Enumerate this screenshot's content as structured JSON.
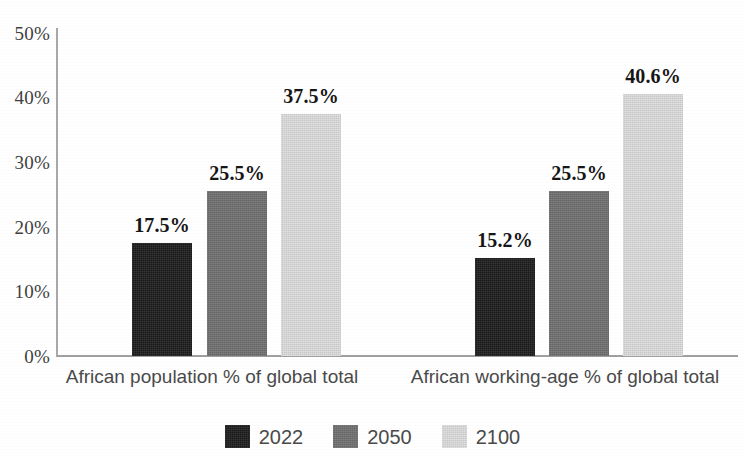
{
  "chart_data": {
    "type": "bar",
    "title": "",
    "subtitle": "",
    "xlabel": "",
    "ylabel": "",
    "categories": [
      "African population % of global total",
      "African working-age % of global total"
    ],
    "series": [
      {
        "name": "2022",
        "color": "#1c1c1c",
        "values": [
          17.5,
          15.2
        ],
        "labels": [
          "17.5%",
          "15.2%"
        ]
      },
      {
        "name": "2050",
        "color": "#6f6f6f",
        "values": [
          25.5,
          25.5
        ],
        "labels": [
          "25.5%",
          "25.5%"
        ]
      },
      {
        "name": "2100",
        "color": "#dddddd",
        "values": [
          37.5,
          40.6
        ],
        "labels": [
          "37.5%",
          "40.6%"
        ]
      }
    ],
    "ylim": [
      0,
      50
    ],
    "ytick_values": [
      0,
      10,
      20,
      30,
      40,
      50
    ],
    "ytick_labels": [
      "0%",
      "10%",
      "20%",
      "30%",
      "40%",
      "50%"
    ],
    "grid": false,
    "legend_position": "bottom",
    "value_labels_shown": true,
    "axis_color": "#a0a0a0",
    "background": "#ffffff"
  },
  "axis": {
    "y": {
      "ticks": [
        {
          "label": "50%",
          "value": 50
        },
        {
          "label": "40%",
          "value": 40
        },
        {
          "label": "30%",
          "value": 30
        },
        {
          "label": "20%",
          "value": 20
        },
        {
          "label": "10%",
          "value": 10
        },
        {
          "label": "0%",
          "value": 0
        }
      ]
    },
    "x": {
      "labels": [
        "African population % of global total",
        "African working-age % of global total"
      ]
    }
  },
  "legend": {
    "items": [
      {
        "label": "2022",
        "color": "#1c1c1c"
      },
      {
        "label": "2050",
        "color": "#6f6f6f"
      },
      {
        "label": "2100",
        "color": "#dddddd"
      }
    ]
  },
  "bars": [
    {
      "group": 0,
      "series": "2022",
      "value": 17.5,
      "label": "17.5%"
    },
    {
      "group": 0,
      "series": "2050",
      "value": 25.5,
      "label": "25.5%"
    },
    {
      "group": 0,
      "series": "2100",
      "value": 37.5,
      "label": "37.5%"
    },
    {
      "group": 1,
      "series": "2022",
      "value": 15.2,
      "label": "15.2%"
    },
    {
      "group": 1,
      "series": "2050",
      "value": 25.5,
      "label": "25.5%"
    },
    {
      "group": 1,
      "series": "2100",
      "value": 40.6,
      "label": "40.6%"
    }
  ]
}
